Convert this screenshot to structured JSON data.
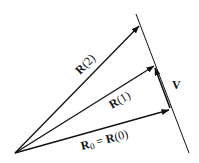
{
  "diagram": {
    "labels": {
      "r2": {
        "bold": "R",
        "rest": "(2)"
      },
      "r1": {
        "bold": "R",
        "rest": "(1)"
      },
      "r0_left_bold": "R",
      "r0_left_sub": "0",
      "r0_eq": " = ",
      "r0_right_bold": "R",
      "r0_right_rest": "(0)",
      "v": "V"
    },
    "colors": {
      "stroke": "#111111",
      "background": "#ffffff"
    }
  }
}
